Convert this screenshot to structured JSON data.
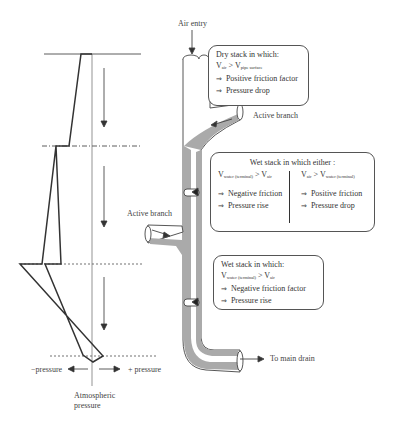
{
  "labels": {
    "air_entry": "Air entry",
    "active_branch_top": "Active branch",
    "active_branch_mid": "Active branch",
    "to_main_drain": "To main drain",
    "minus_pressure": "−pressure",
    "plus_pressure": "+ pressure",
    "atmospheric_line1": "Atmospheric",
    "atmospheric_line2": "pressure"
  },
  "boxes": {
    "dry": {
      "title": "Dry stack in which:",
      "cond_v1": "V",
      "cond_s1": "air",
      "cond_op": " > V",
      "cond_s2": "pipe surface",
      "line1": "Positive friction factor",
      "line2": "Pressure drop"
    },
    "wet_either": {
      "title": "Wet stack in which either :",
      "left_cond_v": "V",
      "left_cond_s1": "water (terminal)",
      "left_cond_op": " > V",
      "left_cond_s2": "air",
      "left_line1": "Negative friction",
      "left_line2": "Pressure rise",
      "right_cond_v": "V",
      "right_cond_s1": "air",
      "right_cond_op": " > V",
      "right_cond_s2": "water (terminal)",
      "right_line1": "Positive friction",
      "right_line2": "Pressure drop"
    },
    "wet": {
      "title": "Wet stack in which:",
      "cond_v": "V",
      "cond_s1": "water (terminal)",
      "cond_op": " > V",
      "cond_s2": "air",
      "line1": "Negative friction factor",
      "line2": "Pressure rise"
    }
  },
  "implies_symbol": "⇒"
}
